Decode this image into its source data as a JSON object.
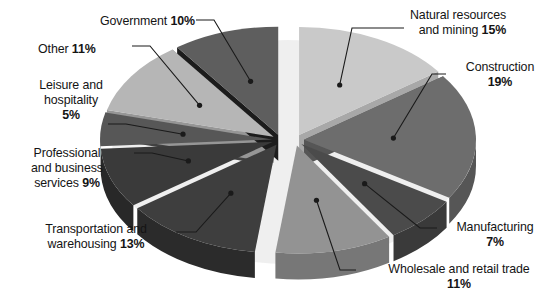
{
  "chart_data": {
    "type": "pie",
    "title": "",
    "subtitle": "",
    "xlabel": "",
    "ylabel": "",
    "legend_position": "none",
    "grid": false,
    "style": "3d-exploded-pie",
    "units": "percent",
    "total": 100,
    "categories": [
      "Natural resources and mining",
      "Construction",
      "Manufacturing",
      "Wholesale and retail trade",
      "Transportation and warehousing",
      "Professional and business services",
      "Leisure and hospitality",
      "Other",
      "Government"
    ],
    "values": [
      15,
      19,
      7,
      11,
      13,
      9,
      5,
      11,
      10
    ],
    "slices": [
      {
        "label": "Natural resources and mining",
        "value": 15,
        "value_text": "15%",
        "label_lines": [
          "Natural resources",
          "and mining "
        ],
        "color": "#c9c9c9",
        "side_color": "#a8a8a8",
        "label_align": "left"
      },
      {
        "label": "Construction",
        "value": 19,
        "value_text": "19%",
        "label_lines": [
          "Construction",
          ""
        ],
        "color": "#6d6d6d",
        "side_color": "#565656",
        "label_align": "left"
      },
      {
        "label": "Manufacturing",
        "value": 7,
        "value_text": "7%",
        "label_lines": [
          "Manufacturing",
          ""
        ],
        "color": "#4b4b4b",
        "side_color": "#3a3a3a",
        "label_align": "left"
      },
      {
        "label": "Wholesale and retail trade",
        "value": 11,
        "value_text": "11%",
        "label_lines": [
          "Wholesale and retail trade",
          ""
        ],
        "color": "#939393",
        "side_color": "#777777",
        "label_align": "center"
      },
      {
        "label": "Transportation and warehousing",
        "value": 13,
        "value_text": "13%",
        "label_lines": [
          "Transportation and",
          "warehousing "
        ],
        "color": "#3e3e3e",
        "side_color": "#2b2b2b",
        "label_align": "right"
      },
      {
        "label": "Professional and business services",
        "value": 9,
        "value_text": "9%",
        "label_lines": [
          "Professional",
          "and business",
          "services "
        ],
        "color": "#3a3a3a",
        "side_color": "#282828",
        "label_align": "right"
      },
      {
        "label": "Leisure and hospitality",
        "value": 5,
        "value_text": "5%",
        "label_lines": [
          "Leisure and",
          "hospitality",
          ""
        ],
        "color": "#575757",
        "side_color": "#414141",
        "label_align": "right"
      },
      {
        "label": "Other",
        "value": 11,
        "value_text": "11%",
        "label_lines": [
          "Other "
        ],
        "color": "#b6b6b6",
        "side_color": "#969696",
        "label_align": "right"
      },
      {
        "label": "Government",
        "value": 10,
        "value_text": "10%",
        "label_lines": [
          "Government "
        ],
        "color": "#5e5e5e",
        "side_color": "#1c1c1c",
        "label_align": "right"
      }
    ]
  },
  "colors": {
    "background": "#ffffff",
    "text": "#141414",
    "leader_line": "#1a1a1a",
    "shadow": "#d0d0d0"
  },
  "labels": {
    "government": {
      "text": "Government ",
      "value": "10%",
      "x": 100,
      "y": 14
    },
    "other": {
      "text": "Other ",
      "value": "11%",
      "x": 38,
      "y": 42
    },
    "leisure": {
      "line1": "Leisure and",
      "line2": "hospitality",
      "value": "5%",
      "x": 12,
      "y": 78
    },
    "professional": {
      "line1": "Professional",
      "line2": "and business",
      "line3": "services ",
      "value": "9%",
      "x": 8,
      "y": 146
    },
    "transportation": {
      "line1": "Transportation and",
      "line2": "warehousing ",
      "value": "13%",
      "x": 32,
      "y": 222
    },
    "wholesale": {
      "line1": "Wholesale and retail trade",
      "value": "11%",
      "x": 368,
      "y": 262
    },
    "manufacturing": {
      "line1": "Manufacturing",
      "value": "7%",
      "x": 443,
      "y": 220
    },
    "construction": {
      "line1": "Construction",
      "value": "19%",
      "x": 452,
      "y": 60
    },
    "natural": {
      "line1": "Natural resources",
      "line2": "and mining ",
      "value": "15%",
      "x": 410,
      "y": 8
    }
  }
}
